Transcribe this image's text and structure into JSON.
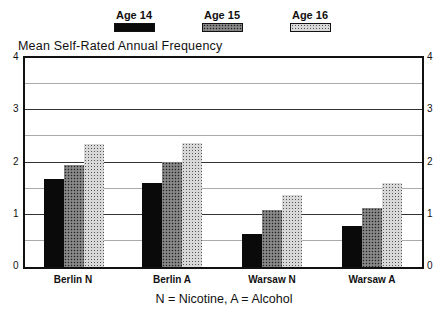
{
  "chart_data": {
    "type": "bar",
    "title": "Mean Self-Rated Annual Frequency",
    "xlabel": "",
    "ylabel": "Mean Self-Rated Annual Frequency",
    "note": "N = Nicotine, A = Alcohol",
    "categories": [
      "Berlin N",
      "Berlin A",
      "Warsaw N",
      "Warsaw A"
    ],
    "series": [
      {
        "name": "Age 14",
        "pattern": "solid-black",
        "values": [
          1.68,
          1.6,
          0.64,
          0.79
        ]
      },
      {
        "name": "Age 15",
        "pattern": "dense-checker",
        "values": [
          1.96,
          2.01,
          1.1,
          1.12
        ]
      },
      {
        "name": "Age 16",
        "pattern": "light-checker",
        "values": [
          2.36,
          2.38,
          1.38,
          1.61
        ]
      }
    ],
    "ylim": [
      0,
      4
    ],
    "yticks": [
      "0",
      "1",
      "2",
      "3",
      "4"
    ],
    "grid": {
      "major": [
        1,
        2,
        3
      ],
      "minor": [
        0.5,
        1.5,
        2.5,
        3.5
      ]
    },
    "legend_position": "top",
    "dual_y_axis_labels": true
  },
  "legend": [
    {
      "label": "Age 14"
    },
    {
      "label": "Age 15"
    },
    {
      "label": "Age 16"
    }
  ]
}
